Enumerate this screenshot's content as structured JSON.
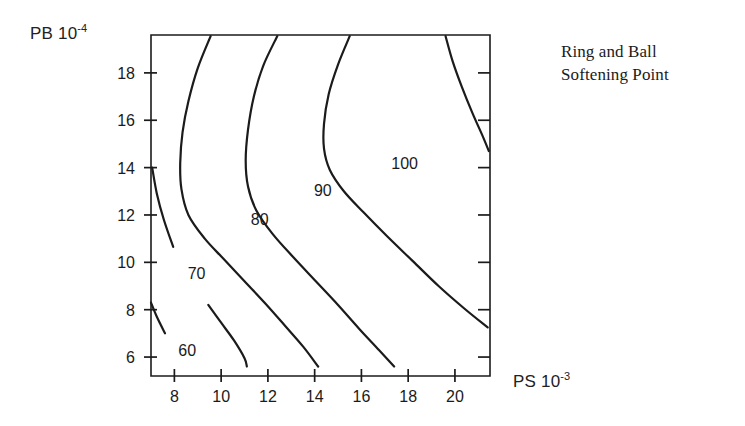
{
  "figure": {
    "width": 745,
    "height": 426,
    "background": "#ffffff",
    "line_color": "#1b1b1b"
  },
  "plot_title": {
    "line1": "Ring and Ball",
    "line2": "Softening Point"
  },
  "axes": {
    "y_title_text": "PB 10",
    "y_title_exponent": "-4",
    "x_title_text": "PS 10",
    "x_title_exponent": "-3"
  },
  "chart_data": {
    "type": "line",
    "subtype": "contour",
    "title": "Ring and Ball Softening Point",
    "xlabel": "PS 10^-3",
    "ylabel": "PB 10^-4",
    "xlim": [
      7.0,
      21.5
    ],
    "ylim": [
      5.2,
      19.6
    ],
    "xticks": [
      8,
      10,
      12,
      14,
      16,
      18,
      20
    ],
    "yticks": [
      6,
      8,
      10,
      12,
      14,
      16,
      18
    ],
    "xtick_labels": [
      "8",
      "10",
      "12",
      "14",
      "16",
      "18",
      "20"
    ],
    "ytick_labels": [
      "6",
      "8",
      "10",
      "12",
      "14",
      "16",
      "18"
    ],
    "grid": false,
    "legend": false,
    "contour_levels": [
      60,
      70,
      80,
      90,
      100
    ],
    "contour_label_text": [
      "60",
      "70",
      "80",
      "90",
      "100"
    ],
    "contour_label_positions": [
      {
        "level": 60,
        "x": 8.55,
        "y": 6.3
      },
      {
        "level": 70,
        "x": 8.95,
        "y": 9.55
      },
      {
        "level": 80,
        "x": 11.65,
        "y": 11.85
      },
      {
        "level": 90,
        "x": 14.35,
        "y": 13.05
      },
      {
        "level": 100,
        "x": 17.85,
        "y": 14.2
      }
    ],
    "contours": [
      {
        "level": 60,
        "points": [
          [
            7.0,
            8.3
          ],
          [
            7.25,
            7.7
          ],
          [
            7.6,
            7.0
          ],
          [
            8.0,
            6.4
          ],
          [
            8.25,
            5.95
          ]
        ]
      },
      {
        "level": 70,
        "points": [
          [
            7.05,
            14.0
          ],
          [
            7.25,
            12.9
          ],
          [
            7.55,
            11.8
          ],
          [
            7.95,
            10.65
          ],
          [
            8.4,
            9.75
          ],
          [
            8.75,
            9.15
          ],
          [
            9.45,
            8.2
          ],
          [
            10.0,
            7.45
          ],
          [
            10.55,
            6.7
          ],
          [
            11.0,
            5.95
          ],
          [
            11.1,
            5.6
          ]
        ]
      },
      {
        "level": 80,
        "points": [
          [
            9.55,
            19.55
          ],
          [
            9.0,
            18.2
          ],
          [
            8.6,
            16.8
          ],
          [
            8.35,
            15.5
          ],
          [
            8.25,
            14.2
          ],
          [
            8.3,
            13.1
          ],
          [
            8.6,
            12.0
          ],
          [
            9.3,
            11.0
          ],
          [
            10.1,
            10.15
          ],
          [
            11.0,
            9.2
          ],
          [
            11.9,
            8.25
          ],
          [
            12.75,
            7.3
          ],
          [
            13.5,
            6.45
          ],
          [
            14.15,
            5.6
          ]
        ]
      },
      {
        "level": 90,
        "points": [
          [
            12.4,
            19.55
          ],
          [
            11.8,
            18.3
          ],
          [
            11.4,
            17.0
          ],
          [
            11.15,
            15.6
          ],
          [
            11.05,
            14.3
          ],
          [
            11.15,
            13.2
          ],
          [
            11.5,
            12.2
          ],
          [
            12.2,
            11.2
          ],
          [
            13.1,
            10.2
          ],
          [
            14.05,
            9.2
          ],
          [
            15.0,
            8.2
          ],
          [
            15.9,
            7.2
          ],
          [
            16.75,
            6.3
          ],
          [
            17.4,
            5.6
          ]
        ]
      },
      {
        "level": 100,
        "points": [
          [
            15.5,
            19.55
          ],
          [
            15.0,
            18.35
          ],
          [
            14.6,
            17.1
          ],
          [
            14.4,
            15.85
          ],
          [
            14.4,
            14.8
          ],
          [
            14.65,
            13.9
          ],
          [
            15.25,
            13.0
          ],
          [
            16.1,
            12.1
          ],
          [
            17.1,
            11.1
          ],
          [
            18.2,
            10.05
          ],
          [
            19.3,
            9.0
          ],
          [
            20.4,
            8.05
          ],
          [
            21.4,
            7.25
          ]
        ]
      },
      {
        "level": 100,
        "branch": "upper-right",
        "points": [
          [
            19.6,
            19.55
          ],
          [
            19.9,
            18.5
          ],
          [
            20.3,
            17.4
          ],
          [
            20.75,
            16.3
          ],
          [
            21.2,
            15.3
          ],
          [
            21.45,
            14.7
          ]
        ]
      }
    ]
  }
}
